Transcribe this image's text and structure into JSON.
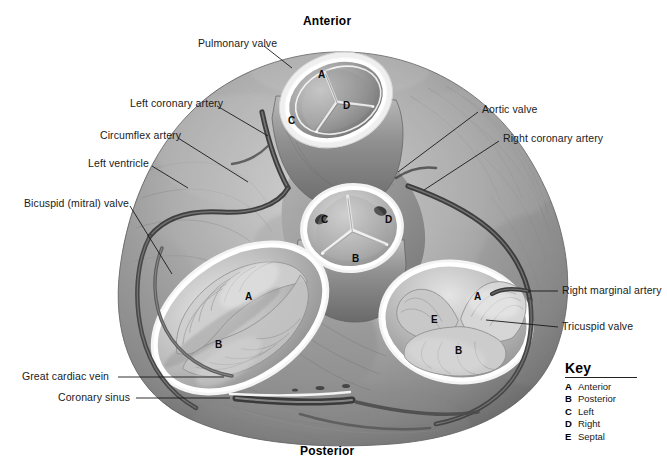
{
  "figure": {
    "orientation": {
      "top_label": "Anterior",
      "bottom_label": "Posterior"
    }
  },
  "labels_left": [
    {
      "id": "pulmonary-valve",
      "text": "Pulmonary valve",
      "x": 198,
      "y": 38,
      "lx1": 264,
      "ly1": 46,
      "lx2": 292,
      "ly2": 68
    },
    {
      "id": "left-coronary-artery",
      "text": "Left coronary artery",
      "x": 130,
      "y": 98,
      "lx1": 217,
      "ly1": 106,
      "lx2": 266,
      "ly2": 132
    },
    {
      "id": "circumflex-artery",
      "text": "Circumflex artery",
      "x": 100,
      "y": 130,
      "lx1": 178,
      "ly1": 138,
      "lx2": 246,
      "ly2": 180
    },
    {
      "id": "left-ventricle",
      "text": "Left ventricle",
      "x": 88,
      "y": 158,
      "lx1": 152,
      "ly1": 166,
      "lx2": 186,
      "ly2": 186
    },
    {
      "id": "bicuspid-mitral-valve",
      "text": "Bicuspid (mitral) valve",
      "x": 24,
      "y": 198,
      "lx1": 130,
      "ly1": 206,
      "lx2": 170,
      "ly2": 272
    },
    {
      "id": "great-cardiac-vein",
      "text": "Great cardiac vein",
      "x": 22,
      "y": 373,
      "lx1": 118,
      "ly1": 377,
      "lx2": 222,
      "ly2": 377
    },
    {
      "id": "coronary-sinus",
      "text": "Coronary sinus",
      "x": 58,
      "y": 394,
      "lx1": 136,
      "ly1": 398,
      "lx2": 228,
      "ly2": 398
    }
  ],
  "labels_right": [
    {
      "id": "aortic-valve",
      "text": "Aortic valve",
      "x": 482,
      "y": 104,
      "lx1": 478,
      "ly1": 112,
      "lx2": 398,
      "ly2": 172
    },
    {
      "id": "right-coronary-artery",
      "text": "Right coronary artery",
      "x": 503,
      "y": 133,
      "lx1": 499,
      "ly1": 141,
      "lx2": 424,
      "ly2": 190
    },
    {
      "id": "right-marginal-artery",
      "text": "Right marginal artery",
      "x": 562,
      "y": 286,
      "lx1": 558,
      "ly1": 291,
      "lx2": 528,
      "ly2": 291
    },
    {
      "id": "tricuspid-valve",
      "text": "Tricuspid valve",
      "x": 562,
      "y": 322,
      "lx1": 558,
      "ly1": 327,
      "lx2": 484,
      "ly2": 320
    }
  ],
  "valve_cusp_letters": [
    {
      "valve": "pulmonary",
      "letter": "A",
      "x": 318,
      "y": 74
    },
    {
      "valve": "pulmonary",
      "letter": "D",
      "x": 343,
      "y": 105
    },
    {
      "valve": "pulmonary",
      "letter": "C",
      "x": 288,
      "y": 120
    },
    {
      "valve": "aortic",
      "letter": "C",
      "x": 321,
      "y": 219
    },
    {
      "valve": "aortic",
      "letter": "D",
      "x": 385,
      "y": 219
    },
    {
      "valve": "aortic",
      "letter": "B",
      "x": 352,
      "y": 258
    },
    {
      "valve": "bicuspid",
      "letter": "A",
      "x": 245,
      "y": 296
    },
    {
      "valve": "bicuspid",
      "letter": "B",
      "x": 215,
      "y": 344
    },
    {
      "valve": "tricuspid",
      "letter": "A",
      "x": 474,
      "y": 296
    },
    {
      "valve": "tricuspid",
      "letter": "E",
      "x": 431,
      "y": 319
    },
    {
      "valve": "tricuspid",
      "letter": "B",
      "x": 455,
      "y": 350
    }
  ],
  "key": {
    "title": "Key",
    "entries": [
      {
        "letter": "A",
        "text": "Anterior"
      },
      {
        "letter": "B",
        "text": "Posterior"
      },
      {
        "letter": "C",
        "text": "Left"
      },
      {
        "letter": "D",
        "text": "Right"
      },
      {
        "letter": "E",
        "text": "Septal"
      }
    ]
  },
  "colors": {
    "background": "#ffffff",
    "label_text": "#1a1a1a",
    "leader_line": "#1a1a1a",
    "tissue_mid": "#9a9a9a",
    "tissue_dark": "#5a5a5a",
    "tissue_light": "#cfcfcf",
    "vessel": "#4a4a4a",
    "valve_rim": "#ffffff"
  }
}
